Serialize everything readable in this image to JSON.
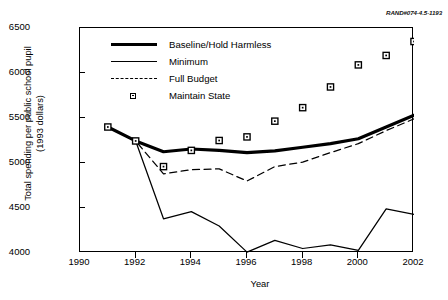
{
  "figure": {
    "rand_id": "RAND#074-4.5-1193"
  },
  "chart_data": {
    "type": "line",
    "title": "",
    "xlabel": "Year",
    "ylabel": "Total spending per public school pupil\n(1993 dollars)",
    "xlim": [
      1990,
      2002
    ],
    "ylim": [
      4000,
      6500
    ],
    "xticks": [
      1990,
      1992,
      1994,
      1996,
      1998,
      2000,
      2002
    ],
    "yticks": [
      4000,
      4500,
      5000,
      5500,
      6000,
      6500
    ],
    "grid": false,
    "legend_position": "upper-left-inside",
    "x": [
      1991,
      1992,
      1993,
      1994,
      1995,
      1996,
      1997,
      1998,
      1999,
      2000,
      2001,
      2002
    ],
    "series": [
      {
        "name": "Baseline/Hold Harmless",
        "style": "thick-solid",
        "values": [
          5400,
          5245,
          5125,
          5155,
          5140,
          5115,
          5135,
          5175,
          5215,
          5270,
          5400,
          5530
        ]
      },
      {
        "name": "Minimum",
        "style": "thin-solid",
        "values": [
          5400,
          5245,
          4380,
          4460,
          4300,
          4010,
          4140,
          4050,
          4090,
          4030,
          4490,
          4430
        ]
      },
      {
        "name": "Full Budget",
        "style": "dashed",
        "values": [
          5400,
          5245,
          4880,
          4925,
          4935,
          4800,
          4960,
          5010,
          5115,
          5215,
          5360,
          5490
        ]
      },
      {
        "name": "Maintain State",
        "style": "square-markers",
        "values": [
          5400,
          5245,
          4960,
          5140,
          5250,
          5290,
          5465,
          5615,
          5845,
          6090,
          6195,
          6350
        ]
      }
    ]
  },
  "legend": {
    "items": [
      {
        "label": "Baseline/Hold Harmless",
        "symbol": "thick-line"
      },
      {
        "label": "Minimum",
        "symbol": "thin-line"
      },
      {
        "label": "Full Budget",
        "symbol": "dashed-line"
      },
      {
        "label": "Maintain State",
        "symbol": "square-marker"
      }
    ]
  }
}
